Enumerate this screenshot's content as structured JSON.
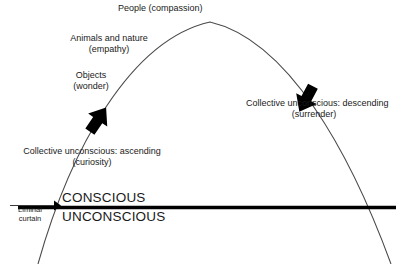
{
  "diagram": {
    "background_color": "#ffffff",
    "line_color": "#4a4a4a",
    "thick_line_color": "#000000",
    "arrow_color": "#000000",
    "text_color": "#1a1a1a",
    "curve_labels": [
      {
        "id": "people",
        "text": "People (compassion)"
      },
      {
        "id": "animals",
        "line1": "Animals and nature",
        "line2": "(empathy)"
      },
      {
        "id": "objects",
        "line1": "Objects",
        "line2": "(wonder)"
      }
    ],
    "arrow_labels": [
      {
        "id": "ascending",
        "line1": "Collective unconscious: ascending",
        "line2": "(curiosity)",
        "direction": "up-right"
      },
      {
        "id": "descending",
        "line1": "Collective unconscious: descending",
        "line2": "(surrender)",
        "direction": "down-right"
      }
    ],
    "divider": {
      "above_label": "CONSCIOUS",
      "below_label": "UNCONSCIOUS"
    },
    "curtain": {
      "line1": "Liminal",
      "line2": "curtain"
    }
  }
}
